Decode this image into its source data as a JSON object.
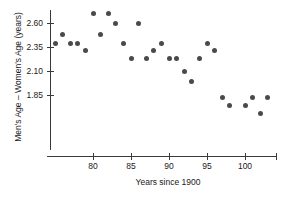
{
  "chart_data": {
    "type": "scatter",
    "title": "",
    "xlabel": "Years since 1900",
    "ylabel": "Men's Age – Women's Age (years)",
    "xlim": [
      74.5,
      104.5
    ],
    "ylim": [
      1.63,
      2.76
    ],
    "grid": false,
    "legend": null,
    "xticks": [
      80,
      85,
      90,
      95,
      100
    ],
    "xtick_labels": [
      "80",
      "85",
      "90",
      "95",
      "100"
    ],
    "yticks": [
      2.6,
      2.35,
      2.1,
      1.85
    ],
    "ytick_labels": [
      "2.60",
      "2.35",
      "2.10",
      "1.85"
    ],
    "marker": "filled-circle",
    "marker_color": "#4a4a4a",
    "axis_color": "#3a3a3a",
    "points": [
      {
        "x": 75,
        "y": 2.39
      },
      {
        "x": 76,
        "y": 2.48
      },
      {
        "x": 77,
        "y": 2.39
      },
      {
        "x": 78,
        "y": 2.39
      },
      {
        "x": 79,
        "y": 2.31
      },
      {
        "x": 80,
        "y": 2.7
      },
      {
        "x": 81,
        "y": 2.48
      },
      {
        "x": 82,
        "y": 2.7
      },
      {
        "x": 83,
        "y": 2.6
      },
      {
        "x": 84,
        "y": 2.39
      },
      {
        "x": 85,
        "y": 2.23
      },
      {
        "x": 86,
        "y": 2.6
      },
      {
        "x": 87,
        "y": 2.23
      },
      {
        "x": 88,
        "y": 2.31
      },
      {
        "x": 89,
        "y": 2.39
      },
      {
        "x": 90,
        "y": 2.23
      },
      {
        "x": 91,
        "y": 2.23
      },
      {
        "x": 92,
        "y": 2.1
      },
      {
        "x": 93,
        "y": 1.99
      },
      {
        "x": 94,
        "y": 2.23
      },
      {
        "x": 95,
        "y": 2.39
      },
      {
        "x": 96,
        "y": 2.31
      },
      {
        "x": 97,
        "y": 1.82
      },
      {
        "x": 98,
        "y": 1.74
      },
      {
        "x": 100,
        "y": 1.74
      },
      {
        "x": 101,
        "y": 1.82
      },
      {
        "x": 102,
        "y": 1.66
      },
      {
        "x": 103,
        "y": 1.82
      }
    ]
  },
  "axis_geometry": {
    "x_origin_px": 93,
    "x_per_unit_px": 7.6,
    "x_origin_value": 80,
    "y_origin_px": 23,
    "y_per_unit_px": 96,
    "y_origin_value": 2.6,
    "x_axis_y_px": 156,
    "y_axis_x_px": 50,
    "x_axis_left_px": 47,
    "x_axis_right_px": 276,
    "y_axis_top_px": 10,
    "y_axis_bottom_px": 150
  }
}
